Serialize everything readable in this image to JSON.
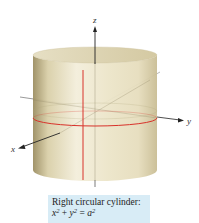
{
  "figure": {
    "title": "Right circular cylinder",
    "axes": {
      "x_label": "x",
      "y_label": "y",
      "z_label": "z"
    },
    "colors": {
      "surface_light": "#f2ecd6",
      "surface_mid": "#e2d8b4",
      "surface_dark": "#a89a6e",
      "trace_red": "#d8322a",
      "axis": "#222222",
      "caption_bg": "#d8ecf6"
    }
  },
  "caption": {
    "line1": "Right circular cylinder:",
    "eq_lhs_x": "x",
    "eq_exp1": "2",
    "eq_plus": " + ",
    "eq_lhs_y": "y",
    "eq_exp2": "2",
    "eq_equals": " = ",
    "eq_rhs_a": "a",
    "eq_exp3": "2"
  }
}
